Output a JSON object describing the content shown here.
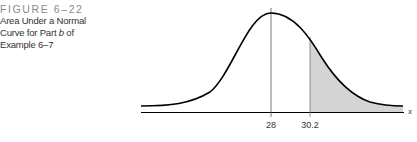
{
  "caption": {
    "figure_number": "FIGURE 6–22",
    "lines": [
      "Area Under a Normal",
      "Curve for Part b of",
      "Example 6–7"
    ]
  },
  "diagram": {
    "type": "normal-curve-shaded-right-tail",
    "mean_label": "28",
    "cutoff_label": "30.2",
    "axis_label": "x",
    "shade_color": "#d4d4d4",
    "line_color": "#000000"
  }
}
